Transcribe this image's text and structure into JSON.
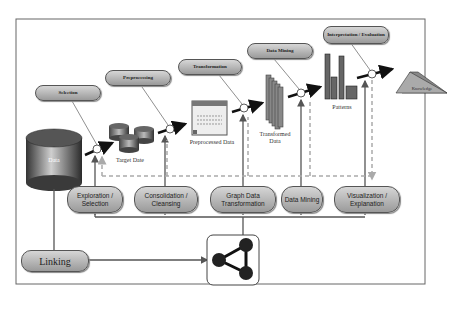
{
  "diagram": {
    "top_stages": [
      {
        "label": "Selection"
      },
      {
        "label": "Preprocessing"
      },
      {
        "label": "Transformation"
      },
      {
        "label": "Data Mining"
      },
      {
        "label": "Interpretation / Evaluation"
      }
    ],
    "artifacts": {
      "data": "Data",
      "target_data": "Target Date",
      "preprocessed_data": "Preprocessed Data",
      "transformed_data": "Transformed Data",
      "patterns": "Patterns",
      "knowledge": "Knowledge"
    },
    "bottom_steps": [
      {
        "label": "Exploration / Selection"
      },
      {
        "label": "Consolidation / Cleansing"
      },
      {
        "label": "Graph Data Transformation"
      },
      {
        "label": "Data Mining"
      },
      {
        "label": "Visualization / Explanation"
      }
    ],
    "linking": {
      "label": "Linking"
    },
    "graph_icon": "graph-network-icon",
    "colors": {
      "pill_light": "#d6d6d6",
      "pill_dark": "#9a9a9a",
      "line": "#555555",
      "dashed": "#aaaaaa",
      "border": "#666666"
    }
  }
}
